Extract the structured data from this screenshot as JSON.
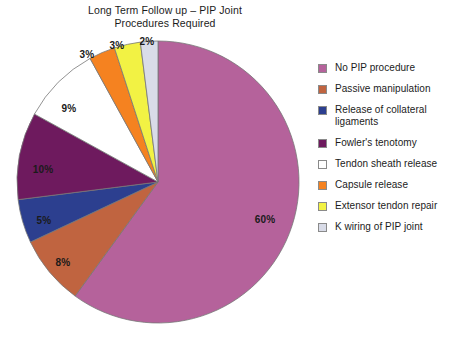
{
  "chart_data": {
    "type": "pie",
    "title": "Long Term Follow up – PIP Joint\nProcedures Required",
    "xlabel": "",
    "ylabel": "",
    "legend_position": "right",
    "grid": false,
    "categories": [
      "No PIP procedure",
      "Passive manipulation",
      "Release of collateral ligaments",
      "Fowler's tenotomy",
      "Tendon sheath release",
      "Capsule release",
      "Extensor tendon repair",
      "K wiring of PIP joint"
    ],
    "values": [
      60,
      8,
      5,
      10,
      9,
      3,
      3,
      2
    ],
    "value_labels": [
      "60%",
      "8%",
      "5%",
      "10%",
      "9%",
      "3%",
      "3%",
      "2%"
    ],
    "colors": [
      "#b5629b",
      "#c06440",
      "#2c3f8f",
      "#6e1a5e",
      "#ffffff",
      "#f58220",
      "#f2f244",
      "#d9dce8"
    ],
    "slices": [
      {
        "label": "No PIP procedure",
        "value": 60,
        "value_label": "60%",
        "color": "#b5629b",
        "label_x": 265,
        "label_y": 219
      },
      {
        "label": "Passive manipulation",
        "value": 8,
        "value_label": "8%",
        "color": "#c06440",
        "label_x": 63,
        "label_y": 262
      },
      {
        "label": "Release of collateral ligaments",
        "value": 5,
        "value_label": "5%",
        "color": "#2c3f8f",
        "label_x": 44,
        "label_y": 220
      },
      {
        "label": "Fowler's tenotomy",
        "value": 10,
        "value_label": "10%",
        "color": "#6e1a5e",
        "label_x": 43,
        "label_y": 169
      },
      {
        "label": "Tendon sheath release",
        "value": 9,
        "value_label": "9%",
        "color": "#ffffff",
        "label_x": 69,
        "label_y": 108
      },
      {
        "label": "Capsule release",
        "value": 3,
        "value_label": "3%",
        "color": "#f58220",
        "label_x": 87,
        "label_y": 54
      },
      {
        "label": "Extensor tendon repair",
        "value": 3,
        "value_label": "3%",
        "color": "#f2f244",
        "label_x": 117,
        "label_y": 45
      },
      {
        "label": "K wiring of PIP joint",
        "value": 2,
        "value_label": "2%",
        "color": "#d9dce8",
        "label_x": 147,
        "label_y": 41
      }
    ]
  },
  "legend": {
    "items": [
      {
        "label": "No PIP procedure",
        "color": "#b5629b"
      },
      {
        "label": "Passive manipulation",
        "color": "#c06440"
      },
      {
        "label": "Release of collateral ligaments",
        "color": "#2c3f8f"
      },
      {
        "label": "Fowler's tenotomy",
        "color": "#6e1a5e"
      },
      {
        "label": "Tendon sheath release",
        "color": "#ffffff"
      },
      {
        "label": "Capsule release",
        "color": "#f58220"
      },
      {
        "label": "Extensor tendon repair",
        "color": "#f2f244"
      },
      {
        "label": "K wiring of PIP joint",
        "color": "#d9dce8"
      }
    ]
  },
  "geometry": {
    "center_x": 158,
    "center_y": 182,
    "radius": 141,
    "start_angle_deg": -90,
    "direction": "clockwise",
    "stroke_color": "#777777"
  }
}
